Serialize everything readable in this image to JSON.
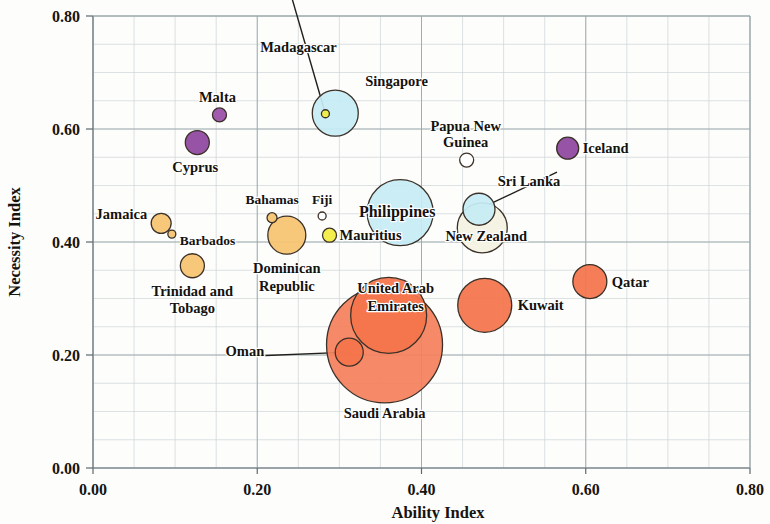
{
  "chart_data": {
    "type": "scatter",
    "subtype": "bubble",
    "title": "",
    "xlabel": "Ability Index",
    "ylabel": "Necessity Index",
    "xlim": [
      0.0,
      0.8
    ],
    "ylim": [
      0.0,
      0.8
    ],
    "xticks": [
      "0.00",
      "0.20",
      "0.40",
      "0.60",
      "0.80"
    ],
    "yticks": [
      "0.00",
      "0.20",
      "0.40",
      "0.60",
      "0.80"
    ],
    "xtick_values": [
      0.0,
      0.2,
      0.4,
      0.6,
      0.8
    ],
    "ytick_values": [
      0.0,
      0.2,
      0.4,
      0.6,
      0.8
    ],
    "grid": "major and minor gridlines, minor every 0.05",
    "legend": "none",
    "bubble_size_meaning": "bubble area encodes a third magnitude variable",
    "points": [
      {
        "label": "Madagascar",
        "x": 0.283,
        "y": 0.627,
        "size": 4,
        "color": "#f2ec3f",
        "label_dx": -27,
        "label_dy": -62,
        "anchor": "middle",
        "leader": [
          -6,
          -52
        ]
      },
      {
        "label": "Singapore",
        "x": 0.295,
        "y": 0.628,
        "size": 23,
        "color": "#c6ecf5",
        "label_dx": 30,
        "label_dy": -27,
        "anchor": "start",
        "leader": null
      },
      {
        "label": "Malta",
        "x": 0.154,
        "y": 0.625,
        "size": 7,
        "color": "#9a4fa8",
        "label_dx": -2,
        "label_dy": -13,
        "anchor": "middle",
        "leader": null
      },
      {
        "label": "Cyprus",
        "x": 0.127,
        "y": 0.576,
        "size": 12,
        "color": "#8f47a0",
        "label_dx": -2,
        "label_dy": 29,
        "anchor": "middle",
        "leader": null
      },
      {
        "label": "Papua New",
        "x": 0.455,
        "y": 0.545,
        "size": 7,
        "color": "#ffffff",
        "label_dx": -1,
        "label_dy": -29,
        "anchor": "middle",
        "leader": null
      },
      {
        "label": "Guinea",
        "x": 0.455,
        "y": 0.545,
        "size": 0,
        "color": "#ffffff",
        "label_dx": -1,
        "label_dy": -13,
        "anchor": "middle",
        "leader": null
      },
      {
        "label": "Iceland",
        "x": 0.578,
        "y": 0.566,
        "size": 11,
        "color": "#8f47a0",
        "label_dx": 15,
        "label_dy": 5,
        "anchor": "start",
        "leader": null
      },
      {
        "label": "Philippines",
        "x": 0.374,
        "y": 0.452,
        "size": 33,
        "color": "#c6ecf5",
        "label_dx": -3,
        "label_dy": 4,
        "anchor": "middle",
        "leader": null
      },
      {
        "label": "Sri Lanka",
        "x": 0.47,
        "y": 0.458,
        "size": 16,
        "color": "#c6ecf5",
        "label_dx": 50,
        "label_dy": -23,
        "anchor": "middle",
        "leader": [
          28,
          -14
        ]
      },
      {
        "label": "New Zealand",
        "x": 0.474,
        "y": 0.425,
        "size": 25,
        "color": "#f4f3e2",
        "label_dx": 4,
        "label_dy": 13,
        "anchor": "middle",
        "leader": null
      },
      {
        "label": "Jamaica",
        "x": 0.083,
        "y": 0.433,
        "size": 10,
        "color": "#f8c470",
        "label_dx": -14,
        "label_dy": -4,
        "anchor": "end",
        "leader": null
      },
      {
        "label": "Barbados",
        "x": 0.096,
        "y": 0.414,
        "size": 4,
        "color": "#f8c470",
        "label_dx": 8,
        "label_dy": 11,
        "anchor": "start",
        "leader": null
      },
      {
        "label": "Trinidad and",
        "x": 0.121,
        "y": 0.358,
        "size": 12,
        "color": "#f8c470",
        "label_dx": 0,
        "label_dy": 30,
        "anchor": "middle",
        "leader": null
      },
      {
        "label": "Tobago",
        "x": 0.121,
        "y": 0.358,
        "size": 0,
        "color": "#f8c470",
        "label_dx": 0,
        "label_dy": 47,
        "anchor": "middle",
        "leader": null
      },
      {
        "label": "Bahamas",
        "x": 0.218,
        "y": 0.443,
        "size": 5,
        "color": "#f8c470",
        "label_dx": 0,
        "label_dy": -14,
        "anchor": "middle",
        "leader": null
      },
      {
        "label": "Dominican",
        "x": 0.236,
        "y": 0.412,
        "size": 19,
        "color": "#f8c470",
        "label_dx": 0,
        "label_dy": 38,
        "anchor": "middle",
        "leader": null
      },
      {
        "label": "Republic",
        "x": 0.236,
        "y": 0.412,
        "size": 0,
        "color": "#f8c470",
        "label_dx": 0,
        "label_dy": 56,
        "anchor": "middle",
        "leader": null
      },
      {
        "label": "Fiji",
        "x": 0.279,
        "y": 0.446,
        "size": 4,
        "color": "#ffffff",
        "label_dx": 0,
        "label_dy": -12,
        "anchor": "middle",
        "leader": null
      },
      {
        "label": "Mauritius",
        "x": 0.288,
        "y": 0.412,
        "size": 7,
        "color": "#f2ec3f",
        "label_dx": 10,
        "label_dy": 5,
        "anchor": "start",
        "leader": null
      },
      {
        "label": "United Arab",
        "x": 0.36,
        "y": 0.27,
        "size": 38,
        "color": "#f4744b",
        "label_dx": 7,
        "label_dy": -22,
        "anchor": "middle",
        "leader": null
      },
      {
        "label": "Emirates",
        "x": 0.36,
        "y": 0.27,
        "size": 0,
        "color": "#f4744b",
        "label_dx": 7,
        "label_dy": -4,
        "anchor": "middle",
        "leader": null
      },
      {
        "label": "Saudi Arabia",
        "x": 0.355,
        "y": 0.218,
        "size": 58,
        "color": "#f4805c",
        "label_dx": 0,
        "label_dy": 73,
        "anchor": "middle",
        "leader": null
      },
      {
        "label": "Oman",
        "x": 0.312,
        "y": 0.205,
        "size": 14,
        "color": "#f4744b",
        "label_dx": -85,
        "label_dy": 4,
        "anchor": "end",
        "leader": [
          -14,
          0
        ]
      },
      {
        "label": "Kuwait",
        "x": 0.477,
        "y": 0.288,
        "size": 27,
        "color": "#f4744b",
        "label_dx": 33,
        "label_dy": 5,
        "anchor": "start",
        "leader": null
      },
      {
        "label": "Qatar",
        "x": 0.605,
        "y": 0.33,
        "size": 17,
        "color": "#f4744b",
        "label_dx": 22,
        "label_dy": 5,
        "anchor": "start",
        "leader": null
      }
    ]
  },
  "colors": {
    "purple": "#8f47a0",
    "light_blue": "#c6ecf5",
    "orange": "#f4744b",
    "light_orange": "#f8c470",
    "yellow": "#f2ec3f",
    "cream": "#f4f3e2",
    "white": "#ffffff",
    "grid_minor": "#cdd4d6",
    "grid_major": "#9aa7ab",
    "text": "#16140f"
  }
}
